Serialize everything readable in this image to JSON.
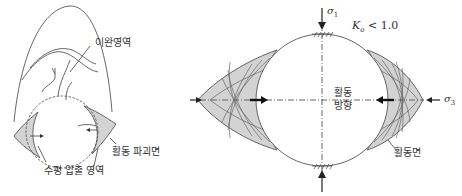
{
  "left_diagram": {
    "labels": {
      "relaxation_zone": "이완영역",
      "sliding_failure_plane": "활동 파괴면",
      "horizontal_compression_zone": "수평 압출 영역"
    }
  },
  "right_diagram": {
    "labels": {
      "sigma1": "σ",
      "sigma1_sub": "1",
      "sigma3": "σ",
      "sigma3_sub": "3",
      "k0_condition_symbol": "K",
      "k0_condition_sub": "o",
      "k0_condition_rest": " < 1.0",
      "sliding_direction_line1": "활동",
      "sliding_direction_line2": "방향",
      "sliding_plane": "활동면"
    }
  },
  "colors": {
    "line": "#555555",
    "fill": "#d3d3d3",
    "text": "#333333"
  }
}
